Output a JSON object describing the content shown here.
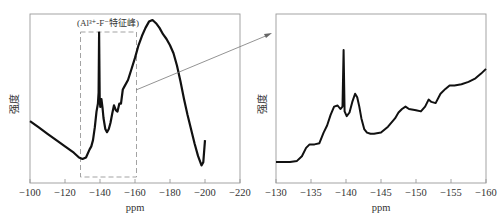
{
  "chart_data": [
    {
      "type": "line",
      "title": "",
      "xlabel": "ppm",
      "ylabel": "强度",
      "xlim": [
        -100,
        -220
      ],
      "x_reversed": true,
      "xticks": [
        -100,
        -120,
        -140,
        -160,
        -180,
        -200,
        -220
      ],
      "xtick_labels": [
        "−100",
        "−120",
        "−140",
        "−160",
        "−180",
        "−200",
        "−220"
      ],
      "yticks": [],
      "grid": false,
      "legend": null,
      "annotation": {
        "text": "(Al³⁺-F⁻特征峰)",
        "box_x_range": [
          -129,
          -161
        ],
        "style": "dashed-box"
      },
      "series": [
        {
          "name": "19F NMR spectrum (full)",
          "x": [
            -100,
            -105,
            -110,
            -115,
            -120,
            -125,
            -128,
            -130,
            -132,
            -134,
            -135,
            -136,
            -137,
            -138,
            -138.8,
            -139.2,
            -139.5,
            -139.8,
            -140.2,
            -140.8,
            -141.5,
            -142,
            -143,
            -144,
            -145,
            -146,
            -147,
            -148,
            -149,
            -150,
            -151,
            -152,
            -153,
            -154,
            -156,
            -158,
            -160,
            -162,
            -164,
            -166,
            -168,
            -170,
            -172,
            -174,
            -176,
            -178,
            -180,
            -182,
            -184,
            -186,
            -188,
            -190,
            -192,
            -194,
            -196,
            -198,
            -199,
            -200
          ],
          "y": [
            0.36,
            0.32,
            0.28,
            0.24,
            0.2,
            0.16,
            0.13,
            0.12,
            0.13,
            0.18,
            0.2,
            0.24,
            0.32,
            0.42,
            0.47,
            0.54,
            0.92,
            0.5,
            0.45,
            0.5,
            0.44,
            0.38,
            0.31,
            0.29,
            0.31,
            0.35,
            0.41,
            0.46,
            0.43,
            0.42,
            0.47,
            0.47,
            0.56,
            0.58,
            0.62,
            0.69,
            0.76,
            0.84,
            0.9,
            0.95,
            0.99,
            1.0,
            0.98,
            0.95,
            0.91,
            0.88,
            0.84,
            0.79,
            0.71,
            0.61,
            0.5,
            0.4,
            0.31,
            0.22,
            0.14,
            0.08,
            0.1,
            0.24
          ]
        }
      ]
    },
    {
      "type": "line",
      "title": "",
      "xlabel": "ppm",
      "ylabel": "强度",
      "xlim": [
        -130,
        -160
      ],
      "x_reversed": true,
      "xticks": [
        -130,
        -135,
        -140,
        -145,
        -150,
        -155,
        -160
      ],
      "xtick_labels": [
        "−130",
        "−135",
        "−140",
        "−145",
        "−150",
        "−155",
        "−160"
      ],
      "yticks": [],
      "grid": false,
      "legend": null,
      "series": [
        {
          "name": "19F NMR spectrum (zoomed −130 to −160 ppm)",
          "x": [
            -130,
            -131,
            -132,
            -133,
            -133.7,
            -134.3,
            -134.8,
            -135.5,
            -136.2,
            -136.8,
            -137.3,
            -137.8,
            -138.3,
            -138.8,
            -139.2,
            -139.5,
            -139.65,
            -139.8,
            -140.1,
            -140.5,
            -140.9,
            -141.3,
            -141.6,
            -141.9,
            -142.2,
            -142.6,
            -143,
            -143.5,
            -144,
            -145,
            -146,
            -147,
            -147.5,
            -148,
            -148.5,
            -149,
            -150,
            -150.7,
            -151.3,
            -151.8,
            -152.2,
            -152.8,
            -153.5,
            -154.2,
            -154.8,
            -155.5,
            -156.5,
            -157.5,
            -158.5,
            -159.3,
            -160
          ],
          "y": [
            0.05,
            0.05,
            0.05,
            0.06,
            0.1,
            0.17,
            0.2,
            0.2,
            0.21,
            0.3,
            0.36,
            0.45,
            0.52,
            0.53,
            0.5,
            0.52,
            1.0,
            0.48,
            0.44,
            0.47,
            0.56,
            0.63,
            0.6,
            0.52,
            0.42,
            0.33,
            0.3,
            0.29,
            0.29,
            0.3,
            0.35,
            0.42,
            0.47,
            0.5,
            0.52,
            0.5,
            0.49,
            0.48,
            0.52,
            0.58,
            0.56,
            0.55,
            0.63,
            0.67,
            0.7,
            0.7,
            0.71,
            0.73,
            0.76,
            0.8,
            0.84
          ]
        }
      ]
    }
  ],
  "left_panel": {
    "xlabel": "ppm",
    "ylabel": "强度",
    "annotation": "(Al³⁺-F⁻特征峰)",
    "xtick_labels": [
      "−100",
      "−120",
      "−140",
      "−160",
      "−180",
      "−200",
      "−220"
    ]
  },
  "right_panel": {
    "xlabel": "ppm",
    "ylabel": "强度",
    "xtick_labels": [
      "−130",
      "−135",
      "−140",
      "−145",
      "−150",
      "−155",
      "−160"
    ]
  },
  "colors": {
    "frame": "#9a9a9a",
    "trace": "#111111",
    "dashed_box": "#999999",
    "arrow": "#777777",
    "text": "#333333"
  }
}
